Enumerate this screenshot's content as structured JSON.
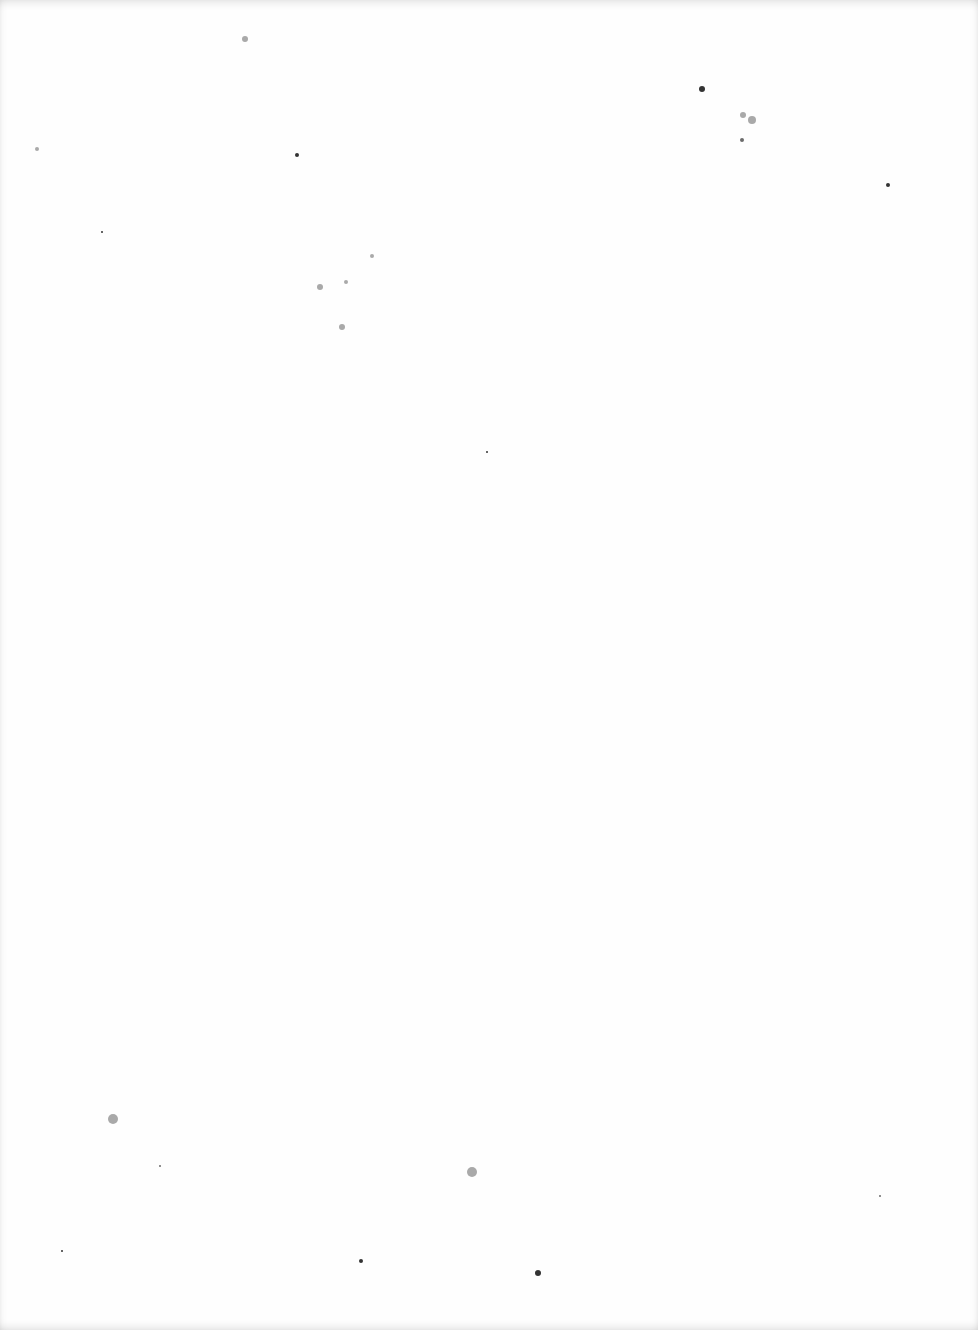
{
  "page": {
    "type": "blank scanned page",
    "background_color": "#fefefe",
    "speck_color": "#6b6b6b"
  },
  "specks": [
    {
      "x": 245,
      "y": 39,
      "r": 3,
      "k": "soft"
    },
    {
      "x": 702,
      "y": 89,
      "r": 3,
      "k": "dark"
    },
    {
      "x": 752,
      "y": 120,
      "r": 4,
      "k": "soft"
    },
    {
      "x": 743,
      "y": 115,
      "r": 3,
      "k": "soft"
    },
    {
      "x": 742,
      "y": 140,
      "r": 2,
      "k": ""
    },
    {
      "x": 37,
      "y": 149,
      "r": 2,
      "k": "soft"
    },
    {
      "x": 297,
      "y": 155,
      "r": 2,
      "k": "dark"
    },
    {
      "x": 888,
      "y": 185,
      "r": 2,
      "k": "dark"
    },
    {
      "x": 372,
      "y": 256,
      "r": 2,
      "k": "soft"
    },
    {
      "x": 320,
      "y": 287,
      "r": 3,
      "k": "soft"
    },
    {
      "x": 346,
      "y": 282,
      "r": 2,
      "k": "soft"
    },
    {
      "x": 342,
      "y": 327,
      "r": 3,
      "k": "soft"
    },
    {
      "x": 102,
      "y": 232,
      "r": 1,
      "k": "dark"
    },
    {
      "x": 487,
      "y": 452,
      "r": 1,
      "k": "dark"
    },
    {
      "x": 113,
      "y": 1119,
      "r": 5,
      "k": "soft"
    },
    {
      "x": 472,
      "y": 1172,
      "r": 5,
      "k": "soft"
    },
    {
      "x": 361,
      "y": 1261,
      "r": 2,
      "k": "dark"
    },
    {
      "x": 538,
      "y": 1273,
      "r": 3,
      "k": "dark"
    },
    {
      "x": 62,
      "y": 1251,
      "r": 1,
      "k": "dark"
    },
    {
      "x": 160,
      "y": 1166,
      "r": 1,
      "k": ""
    },
    {
      "x": 880,
      "y": 1196,
      "r": 1,
      "k": ""
    }
  ]
}
